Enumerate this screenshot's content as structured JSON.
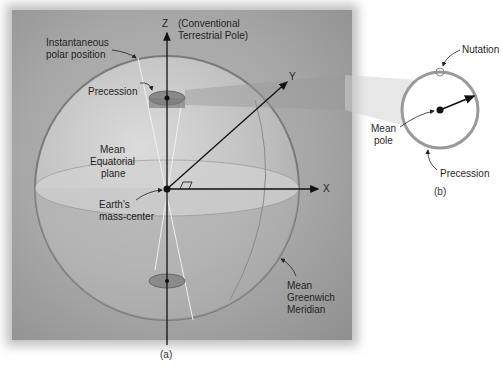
{
  "panel_a": {
    "caption": "(a)",
    "labels": {
      "z_axis": "Z",
      "ctp_line1": "(Conventional",
      "ctp_line2": "Terrestrial Pole)",
      "inst_line1": "Instantaneous",
      "inst_line2": "polar position",
      "precession": "Precession",
      "mep_line1": "Mean",
      "mep_line2": "Equatorial",
      "mep_line3": "plane",
      "y_axis": "Y",
      "x_axis": "X",
      "emc_line1": "Earth's",
      "emc_line2": "mass-center",
      "mgm_line1": "Mean",
      "mgm_line2": "Greenwich",
      "mgm_line3": "Meridian"
    }
  },
  "panel_b": {
    "caption": "(b)",
    "labels": {
      "nutation": "Nutation",
      "mean_pole_line1": "Mean",
      "mean_pole_line2": "pole",
      "precession": "Precession"
    }
  }
}
